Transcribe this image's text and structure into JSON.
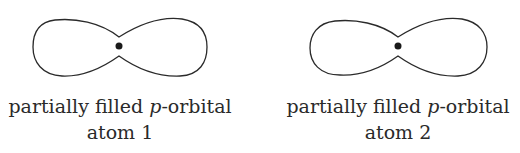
{
  "diagram": {
    "orbitals": [
      {
        "label_pre": "partially filled ",
        "label_italic": "p",
        "label_post": "-orbital",
        "atom": "atom 1"
      },
      {
        "label_pre": "partially filled ",
        "label_italic": "p",
        "label_post": "-orbital",
        "atom": "atom 2"
      }
    ],
    "colors": {
      "stroke": "#2a2a2a",
      "nucleus": "#1a1a1a"
    }
  }
}
